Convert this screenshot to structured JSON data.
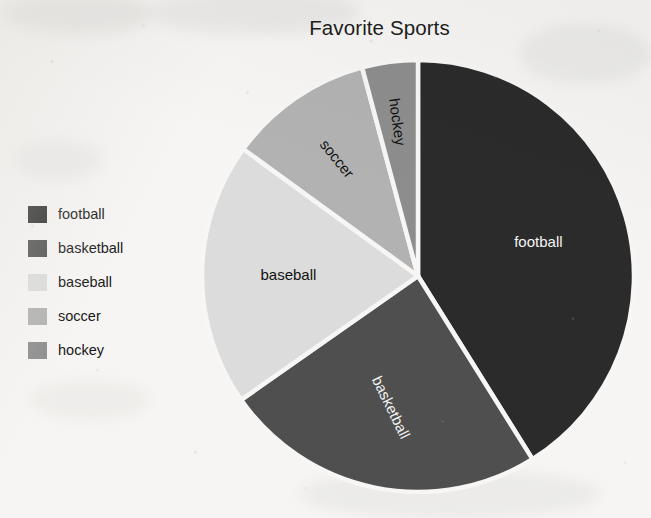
{
  "chart": {
    "title": "Favorite Sports"
  },
  "legend": {
    "items": [
      {
        "label": "football",
        "color": "#2b2b2b"
      },
      {
        "label": "basketball",
        "color": "#4f4f4f"
      },
      {
        "label": "baseball",
        "color": "#dcdcdc"
      },
      {
        "label": "soccer",
        "color": "#b2b2b2"
      },
      {
        "label": "hockey",
        "color": "#8d8d8d"
      }
    ]
  },
  "slice_labels": {
    "football": "football",
    "basketball": "basketball",
    "baseball": "baseball",
    "soccer": "soccer",
    "hockey": "hockey"
  },
  "chart_data": {
    "type": "pie",
    "title": "Favorite Sports",
    "xlabel": "",
    "ylabel": "",
    "legend_position": "left",
    "grid": false,
    "start_angle_deg": 0,
    "direction": "clockwise",
    "categories": [
      "football",
      "basketball",
      "baseball",
      "soccer",
      "hockey"
    ],
    "values": [
      41,
      24,
      20,
      11,
      4
    ],
    "value_unit": "percent",
    "angles_deg": [
      148,
      87,
      71,
      39,
      15
    ],
    "colors": [
      "#2b2b2b",
      "#4f4f4f",
      "#dcdcdc",
      "#b2b2b2",
      "#8d8d8d"
    ],
    "slices": [
      {
        "name": "football",
        "percent": 41,
        "angle_deg": 148,
        "start_deg": 0,
        "end_deg": 148,
        "color": "#2b2b2b",
        "label_color": "light"
      },
      {
        "name": "basketball",
        "percent": 24,
        "angle_deg": 87,
        "start_deg": 148,
        "end_deg": 235,
        "color": "#4f4f4f",
        "label_color": "light"
      },
      {
        "name": "baseball",
        "percent": 20,
        "angle_deg": 71,
        "start_deg": 235,
        "end_deg": 306,
        "color": "#dcdcdc",
        "label_color": "dark"
      },
      {
        "name": "soccer",
        "percent": 11,
        "angle_deg": 39,
        "start_deg": 306,
        "end_deg": 345,
        "color": "#b2b2b2",
        "label_color": "dark"
      },
      {
        "name": "hockey",
        "percent": 4,
        "angle_deg": 15,
        "start_deg": 345,
        "end_deg": 360,
        "color": "#8d8d8d",
        "label_color": "dark"
      }
    ]
  }
}
